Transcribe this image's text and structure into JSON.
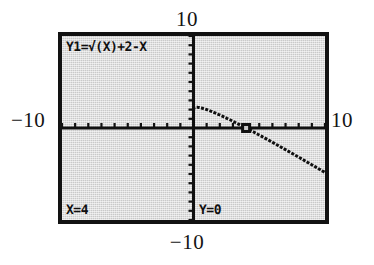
{
  "device": {
    "kind": "graphing-calculator-screen",
    "mode": "trace"
  },
  "screen": {
    "equation_label": "Y1=",
    "radical_symbol": "√",
    "equation_body": "(X)+2-X",
    "equation_full": "Y1=√(X)+2-X",
    "trace_x": "X=4",
    "trace_y": "Y=0",
    "background_color": "#c9c9c9",
    "ink_color": "#101010",
    "border_color": "#121212"
  },
  "window_labels": {
    "ymax": "10",
    "ymin": "−10",
    "xmin": "−10",
    "xmax": "10"
  },
  "chart_data": {
    "type": "line",
    "title": "Y1=√(X)+2-X",
    "xlabel": "",
    "ylabel": "",
    "xlim": [
      -10,
      10
    ],
    "ylim": [
      -10,
      10
    ],
    "xscl": 1,
    "yscl": 1,
    "grid": false,
    "legend": null,
    "axes": {
      "x_axis_at_y": 0,
      "y_axis_at_x": 0,
      "ticks_every": 1
    },
    "series": [
      {
        "name": "Y1",
        "expression": "sqrt(x) + 2 - x",
        "domain": [
          0,
          10
        ],
        "x": [
          0,
          0.25,
          0.5,
          1,
          1.5,
          2,
          2.5,
          3,
          3.5,
          4,
          4.5,
          5,
          5.5,
          6,
          6.5,
          7,
          7.5,
          8,
          8.5,
          9,
          9.5,
          10
        ],
        "y": [
          2.0,
          2.25,
          2.21,
          2.0,
          1.72,
          1.41,
          1.08,
          0.73,
          0.37,
          0.0,
          -0.38,
          -0.76,
          -1.15,
          -1.55,
          -1.95,
          -2.35,
          -2.76,
          -3.17,
          -3.58,
          -4.0,
          -4.42,
          -4.84
        ]
      }
    ],
    "cursor": {
      "label": "trace-cursor",
      "x": 4,
      "y": 0,
      "display_x": "X=4",
      "display_y": "Y=0"
    },
    "annotations": [
      {
        "name": "x-intercept",
        "x": 4,
        "y": 0
      }
    ]
  }
}
